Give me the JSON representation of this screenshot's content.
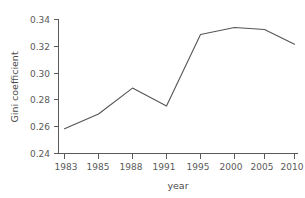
{
  "chart_data": {
    "type": "line",
    "title": "",
    "xlabel": "year",
    "ylabel": "Gini coefficient",
    "categories": [
      "1983",
      "1985",
      "1988",
      "1991",
      "1995",
      "2000",
      "2005",
      "2010"
    ],
    "x": [
      1983,
      1985,
      1988,
      1991,
      1995,
      2000,
      2005,
      2010
    ],
    "values": [
      0.2585,
      0.2695,
      0.2888,
      0.2755,
      0.3288,
      0.334,
      0.3325,
      0.3215
    ],
    "series": [
      {
        "name": "Gini coefficient",
        "values": [
          0.2585,
          0.2695,
          0.2888,
          0.2755,
          0.3288,
          0.334,
          0.3325,
          0.3215
        ]
      }
    ],
    "ylim": [
      0.24,
      0.34
    ],
    "yticks": [
      0.24,
      0.26,
      0.28,
      0.3,
      0.32,
      0.34
    ],
    "ytick_labels": [
      "0.24",
      "0.26",
      "0.28",
      "0.30",
      "0.32",
      "0.34"
    ],
    "xticks": [
      "1983",
      "1985",
      "1988",
      "1991",
      "1995",
      "2000",
      "2005",
      "2010"
    ],
    "xtick_labels": [
      "1983",
      "1985",
      "1988",
      "1991",
      "1995",
      "2000",
      "2005",
      "2010"
    ],
    "x_axis_type": "categorical",
    "grid": false,
    "legend": false,
    "legend_position": "none",
    "line_color": "#555555",
    "axis_color": "#5a5a5a",
    "background_color": "#ffffff",
    "markers": false,
    "annotations": []
  }
}
